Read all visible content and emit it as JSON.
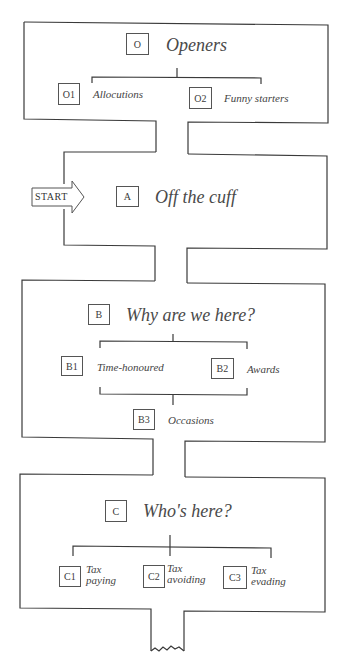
{
  "diagram": {
    "type": "flow-maze",
    "start_label": "START",
    "colors": {
      "line": "#3a3a3a",
      "text": "#444444",
      "background": "#ffffff"
    },
    "sections": [
      {
        "code": "O",
        "title": "Openers",
        "children": [
          {
            "code": "O1",
            "label": "Allocutions"
          },
          {
            "code": "O2",
            "label": "Funny starters"
          }
        ]
      },
      {
        "code": "A",
        "title": "Off the cuff",
        "children": []
      },
      {
        "code": "B",
        "title": "Why are we here?",
        "children": [
          {
            "code": "B1",
            "label": "Time-honoured"
          },
          {
            "code": "B2",
            "label": "Awards"
          },
          {
            "code": "B3",
            "label": "Occasions"
          }
        ]
      },
      {
        "code": "C",
        "title": "Who's here?",
        "children": [
          {
            "code": "C1",
            "label_line1": "Tax",
            "label_line2": "paying"
          },
          {
            "code": "C2",
            "label_line1": "Tax",
            "label_line2": "avoiding"
          },
          {
            "code": "C3",
            "label_line1": "Tax",
            "label_line2": "evading"
          }
        ]
      }
    ]
  }
}
